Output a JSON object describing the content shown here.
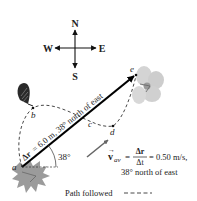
{
  "compass": {
    "north": "N",
    "south": "S",
    "west": "W",
    "east": "E"
  },
  "points": {
    "a": "a",
    "b": "b",
    "c": "c",
    "d": "d",
    "e": "e"
  },
  "displacement": {
    "label_prefix": "Δr",
    "label": "= 6.0 m, 38° north of east",
    "angle_label": "38°"
  },
  "velocity": {
    "symbol": "v",
    "subscript": "av",
    "numerator": "Δr",
    "denominator": "Δt",
    "value": "= 0.50 m/s,",
    "direction": "38° north of east"
  },
  "legend": {
    "path_label": "Path followed",
    "path_sample": "- - - -"
  },
  "colors": {
    "ink": "#111111",
    "arrow": "#000000",
    "small_arrow": "#555555",
    "flower": "#cfcfcf",
    "bottom_plant": "#8a8a8a"
  }
}
